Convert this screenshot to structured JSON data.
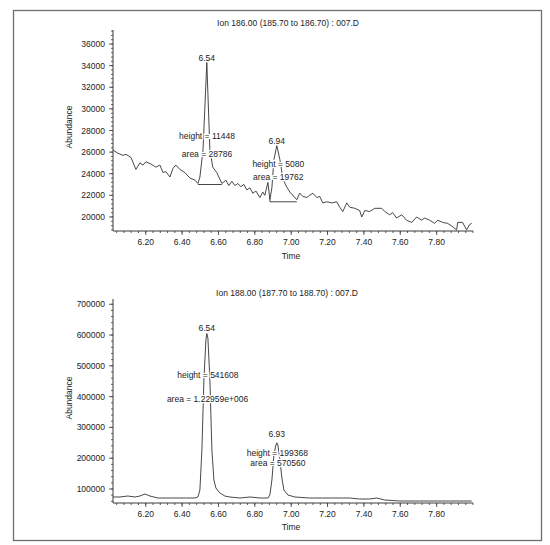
{
  "chart_data": [
    {
      "type": "line",
      "title": "Ion 186.00 (185.70 to 186.70) : 007.D",
      "xlabel": "Time",
      "ylabel": "Abundance",
      "xlim": [
        6.02,
        8.0
      ],
      "ylim": [
        18700,
        37300
      ],
      "grid": false,
      "legend": null,
      "xticks": [
        6.2,
        6.4,
        6.6,
        6.8,
        7.0,
        7.2,
        7.4,
        7.6,
        7.8
      ],
      "xtick_labels": [
        "6.20",
        "6.40",
        "6.60",
        "6.80",
        "7.00",
        "7.20",
        "7.40",
        "7.60",
        "7.80"
      ],
      "x_minor_step": 0.04,
      "yticks": [
        20000,
        22000,
        24000,
        26000,
        28000,
        30000,
        32000,
        34000,
        36000
      ],
      "ytick_labels": [
        "20000",
        "22000",
        "24000",
        "26000",
        "28000",
        "30000",
        "32000",
        "34000",
        "36000"
      ],
      "y_minor_step": 400,
      "peaks": [
        {
          "retention_time": 6.54,
          "height": 11448,
          "area": 28786
        },
        {
          "retention_time": 6.94,
          "height": 5080,
          "area": 19762
        }
      ],
      "series": [
        {
          "name": "Ion 186.00",
          "points": [
            [
              6.02,
              26200
            ],
            [
              6.047,
              25900
            ],
            [
              6.075,
              25700
            ],
            [
              6.091,
              25800
            ],
            [
              6.119,
              25500
            ],
            [
              6.146,
              24400
            ],
            [
              6.168,
              25000
            ],
            [
              6.185,
              24800
            ],
            [
              6.201,
              25100
            ],
            [
              6.229,
              24900
            ],
            [
              6.256,
              24600
            ],
            [
              6.278,
              24800
            ],
            [
              6.295,
              24100
            ],
            [
              6.311,
              24200
            ],
            [
              6.333,
              23700
            ],
            [
              6.35,
              24500
            ],
            [
              6.366,
              24800
            ],
            [
              6.388,
              24400
            ],
            [
              6.416,
              24100
            ],
            [
              6.443,
              23600
            ],
            [
              6.471,
              23400
            ],
            [
              6.487,
              23100
            ],
            [
              6.498,
              23700
            ],
            [
              6.515,
              26200
            ],
            [
              6.536,
              34300
            ],
            [
              6.553,
              26200
            ],
            [
              6.569,
              24600
            ],
            [
              6.591,
              24100
            ],
            [
              6.619,
              23100
            ],
            [
              6.641,
              23400
            ],
            [
              6.657,
              22900
            ],
            [
              6.674,
              23300
            ],
            [
              6.69,
              22900
            ],
            [
              6.707,
              23100
            ],
            [
              6.723,
              22800
            ],
            [
              6.74,
              23000
            ],
            [
              6.756,
              22500
            ],
            [
              6.773,
              22700
            ],
            [
              6.789,
              22200
            ],
            [
              6.806,
              22400
            ],
            [
              6.828,
              21800
            ],
            [
              6.844,
              22300
            ],
            [
              6.855,
              22000
            ],
            [
              6.872,
              23200
            ],
            [
              6.883,
              21600
            ],
            [
              6.894,
              22700
            ],
            [
              6.905,
              25300
            ],
            [
              6.921,
              26600
            ],
            [
              6.938,
              25300
            ],
            [
              6.954,
              23600
            ],
            [
              6.971,
              22900
            ],
            [
              6.993,
              22300
            ],
            [
              7.031,
              21600
            ],
            [
              7.047,
              22200
            ],
            [
              7.064,
              21900
            ],
            [
              7.086,
              21800
            ],
            [
              7.102,
              22000
            ],
            [
              7.119,
              22200
            ],
            [
              7.141,
              21800
            ],
            [
              7.157,
              21900
            ],
            [
              7.174,
              21300
            ],
            [
              7.196,
              21400
            ],
            [
              7.223,
              21300
            ],
            [
              7.251,
              21400
            ],
            [
              7.267,
              20900
            ],
            [
              7.284,
              20500
            ],
            [
              7.306,
              21300
            ],
            [
              7.322,
              20900
            ],
            [
              7.35,
              20800
            ],
            [
              7.377,
              20600
            ],
            [
              7.388,
              20000
            ],
            [
              7.405,
              20600
            ],
            [
              7.432,
              20500
            ],
            [
              7.46,
              20800
            ],
            [
              7.498,
              20800
            ],
            [
              7.515,
              20500
            ],
            [
              7.542,
              20200
            ],
            [
              7.558,
              20400
            ],
            [
              7.58,
              19900
            ],
            [
              7.608,
              20200
            ],
            [
              7.635,
              19700
            ],
            [
              7.663,
              19500
            ],
            [
              7.69,
              20000
            ],
            [
              7.718,
              19700
            ],
            [
              7.734,
              19900
            ],
            [
              7.762,
              19700
            ],
            [
              7.789,
              19400
            ],
            [
              7.806,
              19700
            ],
            [
              7.833,
              19500
            ],
            [
              7.861,
              19400
            ],
            [
              7.888,
              19100
            ],
            [
              7.91,
              18800
            ],
            [
              7.916,
              19500
            ],
            [
              7.943,
              19500
            ],
            [
              7.965,
              18800
            ],
            [
              7.982,
              19300
            ],
            [
              7.993,
              19400
            ]
          ]
        }
      ],
      "baselines": [
        [
          [
            6.487,
            23000
          ],
          [
            6.619,
            23000
          ]
        ],
        [
          [
            6.883,
            21600
          ],
          [
            6.883,
            21400
          ],
          [
            7.031,
            21400
          ]
        ]
      ],
      "annotations": [
        {
          "text": "6.54",
          "x": 6.536,
          "y": 34450
        },
        {
          "text": "height = 11448",
          "x": 6.537,
          "y": 27200
        },
        {
          "text": "area = 28786",
          "x": 6.537,
          "y": 25550
        },
        {
          "text": "6.94",
          "x": 6.921,
          "y": 26760
        },
        {
          "text": "height = 5080",
          "x": 6.929,
          "y": 24630
        },
        {
          "text": "area = 19762",
          "x": 6.929,
          "y": 23430
        }
      ]
    },
    {
      "type": "line",
      "title": "Ion 188.00 (187.70 to 188.70) : 007.D",
      "xlabel": "Time",
      "ylabel": "Abundance",
      "xlim": [
        6.02,
        8.0
      ],
      "ylim": [
        54500,
        717000
      ],
      "grid": false,
      "legend": null,
      "xticks": [
        6.2,
        6.4,
        6.6,
        6.8,
        7.0,
        7.2,
        7.4,
        7.6,
        7.8
      ],
      "xtick_labels": [
        "6.20",
        "6.40",
        "6.60",
        "6.80",
        "7.00",
        "7.20",
        "7.40",
        "7.60",
        "7.80"
      ],
      "x_minor_step": 0.04,
      "yticks": [
        100000,
        200000,
        300000,
        400000,
        500000,
        600000,
        700000
      ],
      "ytick_labels": [
        "100000",
        "200000",
        "300000",
        "400000",
        "500000",
        "600000",
        "700000"
      ],
      "y_minor_step": 20000,
      "peaks": [
        {
          "retention_time": 6.54,
          "height": 541608,
          "area": 1229590
        },
        {
          "retention_time": 6.93,
          "height": 199368,
          "area": 570560
        }
      ],
      "series": [
        {
          "name": "Ion 188.00",
          "points": [
            [
              6.02,
              74000
            ],
            [
              6.058,
              74000
            ],
            [
              6.102,
              77300
            ],
            [
              6.141,
              74000
            ],
            [
              6.168,
              77300
            ],
            [
              6.196,
              83800
            ],
            [
              6.223,
              77300
            ],
            [
              6.267,
              70800
            ],
            [
              6.333,
              70800
            ],
            [
              6.416,
              70800
            ],
            [
              6.471,
              70800
            ],
            [
              6.487,
              74000
            ],
            [
              6.498,
              96800
            ],
            [
              6.509,
              226600
            ],
            [
              6.52,
              453900
            ],
            [
              6.531,
              583800
            ],
            [
              6.536,
              605000
            ],
            [
              6.542,
              590300
            ],
            [
              6.553,
              453900
            ],
            [
              6.564,
              226600
            ],
            [
              6.575,
              129200
            ],
            [
              6.586,
              103200
            ],
            [
              6.608,
              87000
            ],
            [
              6.635,
              77300
            ],
            [
              6.663,
              74000
            ],
            [
              6.718,
              70800
            ],
            [
              6.773,
              74000
            ],
            [
              6.828,
              70800
            ],
            [
              6.872,
              70800
            ],
            [
              6.883,
              80500
            ],
            [
              6.894,
              129200
            ],
            [
              6.905,
              210400
            ],
            [
              6.916,
              242900
            ],
            [
              6.921,
              250000
            ],
            [
              6.927,
              242900
            ],
            [
              6.938,
              194200
            ],
            [
              6.949,
              135700
            ],
            [
              6.96,
              96800
            ],
            [
              6.982,
              80500
            ],
            [
              7.02,
              74000
            ],
            [
              7.102,
              70800
            ],
            [
              7.212,
              70800
            ],
            [
              7.322,
              70800
            ],
            [
              7.377,
              67500
            ],
            [
              7.432,
              67500
            ],
            [
              7.471,
              70800
            ],
            [
              7.515,
              64300
            ],
            [
              7.597,
              61000
            ],
            [
              7.707,
              61000
            ],
            [
              7.871,
              61000
            ],
            [
              7.993,
              61000
            ]
          ]
        }
      ],
      "baselines": [],
      "annotations": [
        {
          "text": "6.54",
          "x": 6.536,
          "y": 613000
        },
        {
          "text": "height = 541608",
          "x": 6.542,
          "y": 460400
        },
        {
          "text": "area = 1.22959e+006",
          "x": 6.54,
          "y": 382500
        },
        {
          "text": "6.93",
          "x": 6.921,
          "y": 268800
        },
        {
          "text": "height = 199368",
          "x": 6.924,
          "y": 207000
        },
        {
          "text": "area = 570560",
          "x": 6.927,
          "y": 174700
        }
      ]
    }
  ]
}
